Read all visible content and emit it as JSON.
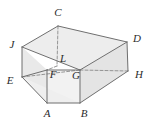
{
  "figure": {
    "type": "geometric-solid",
    "shape_description": "Oblique prism / truncated box drawn in two-point perspective with hidden edges dashed",
    "canvas": {
      "width": 152,
      "height": 121
    },
    "colors": {
      "background": "#ffffff",
      "face_fill": "#ededed",
      "face_fill_light": "#f4f4f4",
      "face_fill_dark": "#e2e2e2",
      "edge_stroke": "#6f6f6f",
      "hidden_edge_stroke": "#8a8a8a",
      "label_text": "#2b2b2b"
    },
    "stroke_widths": {
      "visible_edge": 1,
      "hidden_edge": 0.9
    },
    "hidden_edge_dash": "3,2",
    "vertices": [
      {
        "id": "C",
        "label": "C",
        "x": 58,
        "y": 26,
        "label_x": 58,
        "label_y": 12,
        "hidden": false
      },
      {
        "id": "J",
        "label": "J",
        "x": 22,
        "y": 47,
        "label_x": 12,
        "label_y": 44,
        "hidden": false
      },
      {
        "id": "D",
        "label": "D",
        "x": 127,
        "y": 42,
        "label_x": 137,
        "label_y": 38,
        "hidden": false
      },
      {
        "id": "L",
        "label": "L",
        "x": 57,
        "y": 66,
        "label_x": 63,
        "label_y": 58,
        "hidden": true
      },
      {
        "id": "E",
        "label": "E",
        "x": 22,
        "y": 77,
        "label_x": 10,
        "label_y": 80,
        "hidden": false
      },
      {
        "id": "F",
        "label": "F",
        "x": 47,
        "y": 70,
        "label_x": 53,
        "label_y": 74,
        "hidden": false
      },
      {
        "id": "G",
        "label": "G",
        "x": 80,
        "y": 70,
        "label_x": 76,
        "label_y": 75,
        "hidden": false
      },
      {
        "id": "H",
        "label": "H",
        "x": 128,
        "y": 71,
        "label_x": 139,
        "label_y": 74,
        "hidden": false
      },
      {
        "id": "A",
        "label": "A",
        "x": 47,
        "y": 103,
        "label_x": 47,
        "label_y": 113,
        "hidden": false
      },
      {
        "id": "B",
        "label": "B",
        "x": 80,
        "y": 103,
        "label_x": 84,
        "label_y": 113,
        "hidden": false
      }
    ],
    "faces": [
      {
        "id": "top-face",
        "points": "22,47 58,26 127,42 80,70",
        "fill": "#ededed"
      },
      {
        "id": "right-face",
        "points": "127,42 128,71 80,103 80,70",
        "fill": "#e4e4e4"
      },
      {
        "id": "front-face",
        "points": "47,70 80,70 80,103 47,103",
        "fill": "#f2f2f2"
      },
      {
        "id": "left-lower-face",
        "points": "22,47 22,77 47,103 47,70",
        "fill": "#e9e9e9"
      },
      {
        "id": "bottom-wedge",
        "points": "22,77 47,103 80,103",
        "fill": "#efefef"
      }
    ],
    "visible_edges": [
      {
        "id": "J-C",
        "from": "J",
        "to": "C"
      },
      {
        "id": "C-D",
        "from": "C",
        "to": "D"
      },
      {
        "id": "D-H",
        "from": "D",
        "to": "H"
      },
      {
        "id": "J-E",
        "from": "J",
        "to": "E"
      },
      {
        "id": "E-A",
        "from": "E",
        "to": "A"
      },
      {
        "id": "A-B",
        "from": "A",
        "to": "B"
      },
      {
        "id": "B-H",
        "from": "B",
        "to": "H"
      },
      {
        "id": "J-G",
        "from": "J",
        "to": "G"
      },
      {
        "id": "G-D",
        "from": "G",
        "to": "D"
      },
      {
        "id": "F-G",
        "from": "F",
        "to": "G"
      },
      {
        "id": "F-A",
        "from": "F",
        "to": "A"
      },
      {
        "id": "G-B",
        "from": "G",
        "to": "B"
      },
      {
        "id": "E-F",
        "from": "E",
        "to": "F"
      }
    ],
    "hidden_edges": [
      {
        "id": "C-L",
        "from": "C",
        "to": "L"
      },
      {
        "id": "L-F",
        "from": "L",
        "to": "F"
      },
      {
        "id": "E-G",
        "from": "E",
        "to": "G"
      },
      {
        "id": "G-H",
        "from": "G",
        "to": "H"
      }
    ]
  }
}
